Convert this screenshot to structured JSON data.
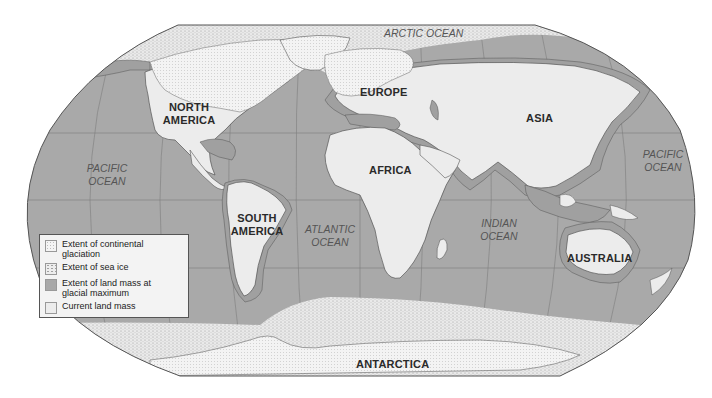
{
  "map": {
    "continents": {
      "north_america": [
        "NORTH",
        "AMERICA"
      ],
      "south_america": [
        "SOUTH",
        "AMERICA"
      ],
      "europe": "EUROPE",
      "africa": "AFRICA",
      "asia": "ASIA",
      "australia": "AUSTRALIA",
      "antarctica": "ANTARCTICA"
    },
    "oceans": {
      "arctic": "ARCTIC OCEAN",
      "pacific_west": [
        "PACIFIC",
        "OCEAN"
      ],
      "pacific_east": [
        "PACIFIC",
        "OCEAN"
      ],
      "atlantic": [
        "ATLANTIC",
        "OCEAN"
      ],
      "indian": [
        "INDIAN",
        "OCEAN"
      ]
    },
    "colors": {
      "ocean": "#a9a9a9",
      "glacial_land": "#a0a0a0",
      "current_land": "#ececec",
      "glaciation": "#f2f2f2",
      "sea_ice": "#e6e6e6",
      "outline": "#555555",
      "grid": "#7a7a7a"
    }
  },
  "legend": {
    "items": [
      {
        "swatch": "glaciation-pattern",
        "label": "Extent of continental glaciation"
      },
      {
        "swatch": "sea-ice-pattern",
        "label": "Extent of sea ice"
      },
      {
        "swatch": "glacial-land-fill",
        "label": "Extent of land mass at glacial maximum"
      },
      {
        "swatch": "current-land-fill",
        "label": "Current land mass"
      }
    ]
  }
}
